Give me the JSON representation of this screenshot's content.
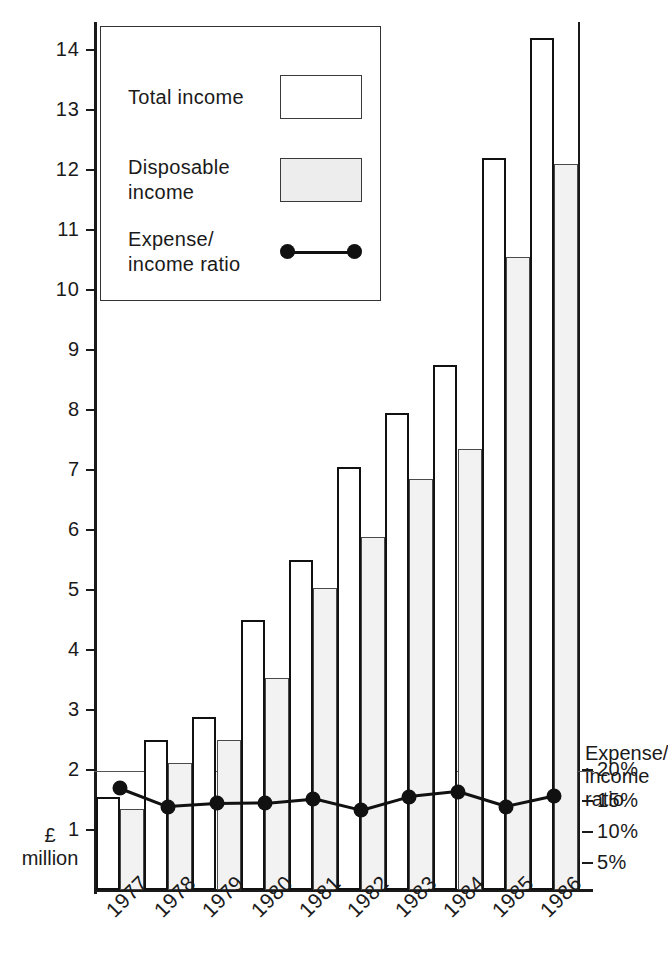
{
  "chart_data": {
    "type": "bar",
    "title": "",
    "xlabel": "",
    "ylabel": "£ million",
    "ylim": [
      0,
      14.6
    ],
    "ytick_values": [
      1,
      2,
      3,
      4,
      5,
      6,
      7,
      8,
      9,
      10,
      11,
      12,
      13,
      14
    ],
    "ytick_labels": [
      "1",
      "2",
      "3",
      "4",
      "5",
      "6",
      "7",
      "8",
      "9",
      "10",
      "11",
      "12",
      "13",
      "14"
    ],
    "categories": [
      "1977",
      "1978",
      "1979",
      "1980",
      "1981",
      "1982",
      "1983",
      "1984",
      "1985",
      "1986"
    ],
    "grid": false,
    "legend_position": "upper-left-inset",
    "series": [
      {
        "name": "Total income",
        "unit": "£ million",
        "values": [
          1.55,
          2.5,
          2.88,
          4.5,
          5.5,
          7.05,
          7.95,
          8.75,
          12.2,
          14.2
        ]
      },
      {
        "name": "Disposable income",
        "unit": "£ million",
        "values": [
          1.35,
          2.12,
          2.5,
          3.53,
          5.03,
          5.88,
          6.85,
          7.35,
          10.55,
          12.1
        ]
      }
    ],
    "secondary_axis": {
      "name": "Expense/income ratio",
      "label": "Expense/\nincome\nratio",
      "tick_values": [
        5,
        10,
        15,
        20
      ],
      "tick_labels": [
        "5%",
        "10%",
        "15%",
        "20%"
      ],
      "ylim": [
        0,
        23
      ],
      "values": [
        17.1,
        14.1,
        14.6,
        14.7,
        15.4,
        13.5,
        15.7,
        16.5,
        14.1,
        15.8
      ]
    }
  },
  "legend": {
    "items": [
      {
        "label": "Total income",
        "swatch": "white-rectangle"
      },
      {
        "label": "Disposable\nincome",
        "swatch": "grey-rectangle"
      },
      {
        "label": "Expense/\nincome ratio",
        "swatch": "line-with-dots"
      }
    ],
    "item0_label": "Total income",
    "item1_label_line1": "Disposable",
    "item1_label_line2": "income",
    "item2_label_line1": "Expense/",
    "item2_label_line2": "income ratio"
  },
  "axes": {
    "left_unit_line1": "£",
    "left_unit_line2": "million",
    "right_caption_line1": "Expense/",
    "right_caption_line2": "income",
    "right_caption_line3": "ratio"
  },
  "colors": {
    "ink": "#1a1a1a",
    "bar_total_fill": "#ffffff",
    "bar_disposable_fill": "#f2f2f2",
    "bar_stroke": "#111111",
    "ratio_line": "#111111",
    "background": "#ffffff"
  }
}
